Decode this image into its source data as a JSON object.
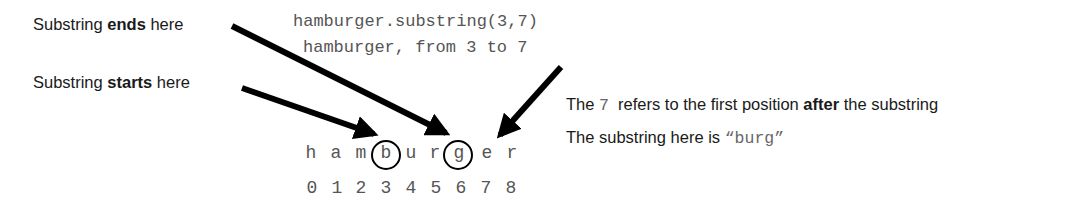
{
  "labels": {
    "ends": {
      "prefix": "Substring ",
      "bold": "ends",
      "suffix": " here"
    },
    "starts": {
      "prefix": "Substring ",
      "bold": "starts",
      "suffix": " here"
    }
  },
  "code": {
    "line1": "hamburger.substring(3,7)",
    "line2": "hamburger, from 3 to 7"
  },
  "explanation": {
    "line1": {
      "prefix": "The ",
      "code": "7",
      "middle": "  refers to the first position ",
      "bold": "after",
      "suffix": " the substring"
    },
    "line2": {
      "prefix": "The substring here is ",
      "code": "“burg”"
    }
  },
  "word": {
    "chars": [
      "h",
      "a",
      "m",
      "b",
      "u",
      "r",
      "g",
      "e",
      "r"
    ],
    "indices": [
      "0",
      "1",
      "2",
      "3",
      "4",
      "5",
      "6",
      "7",
      "8"
    ],
    "circled_indices": [
      3,
      6
    ]
  }
}
